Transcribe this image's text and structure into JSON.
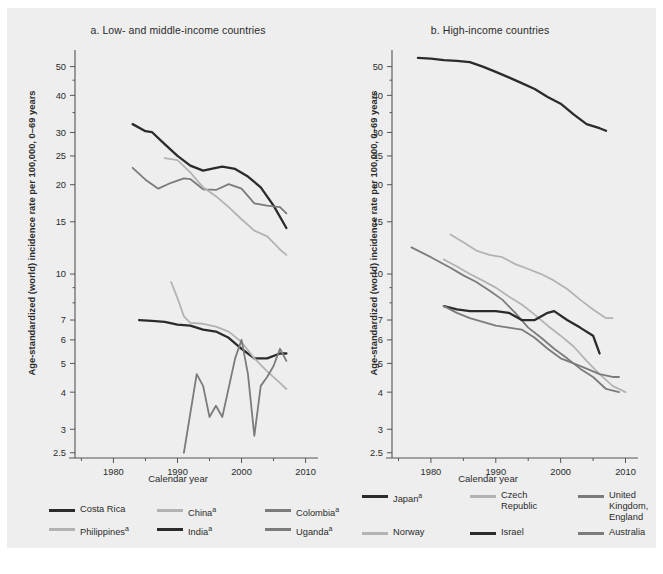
{
  "figure": {
    "background": "#eeeeee",
    "ylabel": "Age-standardized (world) incidence rate per 100,000, 0–69 years",
    "xlabel": "Calendar year"
  },
  "colors": {
    "dark": "#2b2b2b",
    "medium": "#7b7b7b",
    "light": "#b3b3b3",
    "axis": "#555555",
    "text": "#2b2b2b"
  },
  "panel_a": {
    "title": "a. Low- and middle-income countries",
    "xlabel": "Calendar year",
    "ylabel": "Age-standardized (world) incidence rate per 100,000, 0–69 years",
    "legend": [
      [
        {
          "label": "Costa Rica",
          "sup": "",
          "color": "#2b2b2b"
        },
        {
          "label": "China",
          "sup": "a",
          "color": "#b3b3b3"
        },
        {
          "label": "Colombia",
          "sup": "a",
          "color": "#7b7b7b"
        }
      ],
      [
        {
          "label": "Philippines",
          "sup": "a",
          "color": "#b3b3b3"
        },
        {
          "label": "India",
          "sup": "a",
          "color": "#2b2b2b"
        },
        {
          "label": "Uganda",
          "sup": "a",
          "color": "#7b7b7b"
        }
      ]
    ]
  },
  "panel_b": {
    "title": "b. High-income countries",
    "xlabel": "Calendar year",
    "ylabel": "Age-standardized (world) incidence rate per 100,000, 0–69 years",
    "legend": [
      [
        {
          "label": "Japan",
          "sup": "a",
          "color": "#2b2b2b"
        },
        {
          "label": "Czech Republic",
          "sup": "",
          "color": "#b3b3b3"
        },
        {
          "label": "United Kingdom,\nEngland",
          "sup": "",
          "color": "#7b7b7b"
        }
      ],
      [
        {
          "label": "Norway",
          "sup": "",
          "color": "#b3b3b3"
        },
        {
          "label": "Israel",
          "sup": "",
          "color": "#2b2b2b"
        },
        {
          "label": "Australia",
          "sup": "",
          "color": "#7b7b7b"
        }
      ]
    ]
  },
  "chart_data": [
    {
      "id": "panel_a",
      "type": "line",
      "title": "a. Low- and middle-income countries",
      "xlabel": "Calendar year",
      "ylabel": "Age-standardized (world) incidence rate per 100,000, 0–69 years",
      "yscale": "log",
      "ylim": [
        2.4,
        56
      ],
      "xlim": [
        1974,
        2011
      ],
      "yticks": [
        2.5,
        3,
        4,
        5,
        6,
        7,
        10,
        15,
        20,
        25,
        30,
        40,
        50
      ],
      "ytick_labels": [
        "2.5",
        "3",
        "4",
        "5",
        "6",
        "7",
        "10",
        "15",
        "20",
        "25",
        "30",
        "40",
        "50"
      ],
      "xticks": [
        1980,
        1990,
        2000,
        2010
      ],
      "xtick_labels": [
        "1980",
        "1990",
        "2000",
        "2010"
      ],
      "grid": false,
      "legend_position": "below",
      "series": [
        {
          "name": "Costa Rica",
          "color": "#2b2b2b",
          "x": [
            1983,
            1985,
            1986,
            1988,
            1990,
            1992,
            1994,
            1996,
            1997,
            1999,
            2001,
            2003,
            2005,
            2007
          ],
          "y": [
            32.0,
            30.3,
            30.1,
            27.4,
            25.0,
            23.2,
            22.3,
            22.8,
            23.0,
            22.6,
            21.3,
            19.6,
            17.0,
            14.3
          ]
        },
        {
          "name": "Colombia",
          "color": "#7b7b7b",
          "x": [
            1983,
            1985,
            1987,
            1989,
            1991,
            1992,
            1994,
            1996,
            1998,
            2000,
            2002,
            2004,
            2006,
            2007
          ],
          "y": [
            22.8,
            20.8,
            19.4,
            20.3,
            21.0,
            20.9,
            19.3,
            19.2,
            20.1,
            19.4,
            17.3,
            17.0,
            16.8,
            16.0
          ]
        },
        {
          "name": "China",
          "color": "#b3b3b3",
          "x": [
            1988,
            1990,
            1992,
            1994,
            1996,
            1998,
            2000,
            2002,
            2004,
            2006,
            2007
          ],
          "y": [
            24.6,
            24.2,
            22.0,
            19.6,
            18.3,
            16.8,
            15.3,
            14.0,
            13.4,
            12.1,
            11.6
          ]
        },
        {
          "name": "India",
          "color": "#2b2b2b",
          "x": [
            1984,
            1986,
            1988,
            1990,
            1992,
            1994,
            1996,
            1998,
            2000,
            2002,
            2004,
            2006,
            2007
          ],
          "y": [
            7.0,
            6.95,
            6.9,
            6.75,
            6.7,
            6.5,
            6.4,
            6.1,
            5.6,
            5.2,
            5.2,
            5.4,
            5.4
          ]
        },
        {
          "name": "Philippines",
          "color": "#b3b3b3",
          "x": [
            1989,
            1990,
            1991,
            1992,
            1994,
            1996,
            1998,
            2000,
            2002,
            2004,
            2006,
            2007
          ],
          "y": [
            9.4,
            8.3,
            7.2,
            6.85,
            6.8,
            6.65,
            6.4,
            5.9,
            5.2,
            4.7,
            4.3,
            4.1
          ]
        },
        {
          "name": "Uganda",
          "color": "#7b7b7b",
          "x": [
            1991,
            1993,
            1994,
            1995,
            1996,
            1997,
            1999,
            2000,
            2001,
            2002,
            2003,
            2004,
            2005,
            2006,
            2007
          ],
          "y": [
            2.5,
            4.6,
            4.2,
            3.3,
            3.6,
            3.3,
            5.2,
            6.0,
            4.6,
            2.85,
            4.2,
            4.5,
            4.9,
            5.6,
            5.1
          ]
        }
      ]
    },
    {
      "id": "panel_b",
      "type": "line",
      "title": "b. High-income countries",
      "xlabel": "Calendar year",
      "ylabel": "Age-standardized (world) incidence rate per 100,000, 0–69 years",
      "yscale": "log",
      "ylim": [
        2.4,
        56
      ],
      "xlim": [
        1974,
        2011
      ],
      "yticks": [
        2.5,
        3,
        4,
        5,
        6,
        7,
        10,
        15,
        20,
        25,
        30,
        40,
        50
      ],
      "ytick_labels": [
        "2.5",
        "3",
        "4",
        "5",
        "6",
        "7",
        "10",
        "15",
        "20",
        "25",
        "30",
        "40",
        "50"
      ],
      "xticks": [
        1980,
        1990,
        2000,
        2010
      ],
      "xtick_labels": [
        "1980",
        "1990",
        "2000",
        "2010"
      ],
      "grid": false,
      "legend_position": "below",
      "series": [
        {
          "name": "Japan",
          "color": "#2b2b2b",
          "x": [
            1978,
            1980,
            1982,
            1984,
            1986,
            1988,
            1990,
            1992,
            1994,
            1996,
            1998,
            2000,
            2002,
            2004,
            2006,
            2007
          ],
          "y": [
            53.5,
            53.2,
            52.6,
            52.3,
            51.8,
            50.0,
            48.0,
            46.0,
            44.0,
            42.0,
            39.5,
            37.5,
            34.5,
            32.0,
            31.0,
            30.4
          ]
        },
        {
          "name": "Czech Republic",
          "color": "#b3b3b3",
          "x": [
            1983,
            1985,
            1987,
            1989,
            1991,
            1993,
            1995,
            1997,
            1999,
            2001,
            2003,
            2005,
            2007,
            2008
          ],
          "y": [
            13.6,
            12.8,
            12.0,
            11.6,
            11.4,
            10.8,
            10.4,
            10.0,
            9.5,
            8.9,
            8.2,
            7.6,
            7.1,
            7.1
          ]
        },
        {
          "name": "United Kingdom, England",
          "color": "#7b7b7b",
          "x": [
            1977,
            1980,
            1983,
            1985,
            1987,
            1989,
            1991,
            1993,
            1995,
            1997,
            1999,
            2001,
            2003,
            2005,
            2007,
            2009
          ],
          "y": [
            12.3,
            11.4,
            10.5,
            9.9,
            9.4,
            8.8,
            8.2,
            7.4,
            6.6,
            6.1,
            5.6,
            5.2,
            4.8,
            4.5,
            4.1,
            4.0
          ]
        },
        {
          "name": "Norway",
          "color": "#b3b3b3",
          "x": [
            1982,
            1984,
            1986,
            1988,
            1990,
            1992,
            1994,
            1996,
            1998,
            2000,
            2002,
            2004,
            2006,
            2008,
            2010
          ],
          "y": [
            11.2,
            10.6,
            10.0,
            9.5,
            9.0,
            8.4,
            7.9,
            7.3,
            6.7,
            6.2,
            5.7,
            5.1,
            4.6,
            4.2,
            4.0
          ]
        },
        {
          "name": "Israel",
          "color": "#2b2b2b",
          "x": [
            1982,
            1984,
            1986,
            1988,
            1990,
            1992,
            1994,
            1996,
            1998,
            1999,
            2001,
            2003,
            2005,
            2006
          ],
          "y": [
            7.8,
            7.6,
            7.5,
            7.5,
            7.5,
            7.4,
            7.0,
            7.0,
            7.4,
            7.5,
            7.0,
            6.6,
            6.2,
            5.4
          ]
        },
        {
          "name": "Australia",
          "color": "#7b7b7b",
          "x": [
            1982,
            1984,
            1986,
            1988,
            1990,
            1992,
            1994,
            1996,
            1998,
            2000,
            2002,
            2004,
            2006,
            2008,
            2009
          ],
          "y": [
            7.8,
            7.4,
            7.1,
            6.9,
            6.7,
            6.6,
            6.5,
            6.1,
            5.6,
            5.2,
            5.0,
            4.8,
            4.6,
            4.5,
            4.5
          ]
        }
      ]
    }
  ]
}
